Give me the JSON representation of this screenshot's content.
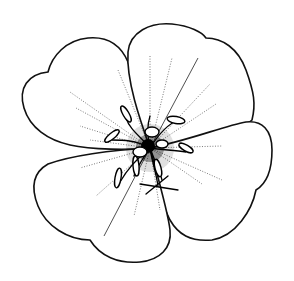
{
  "image": {
    "subject": "Flower line drawing",
    "description": "Botanical pen illustration of a five-petaled flower, top view, with notched petals, radiating stippled veins and a dense cluster of stamens and anthers at the centre",
    "width": 294,
    "height": 281,
    "colors": {
      "background": "#ffffff",
      "ink": "#111111"
    },
    "petal_count": 5,
    "petals": [
      {
        "position": "upper-left"
      },
      {
        "position": "upper-right"
      },
      {
        "position": "right"
      },
      {
        "position": "lower-right"
      },
      {
        "position": "lower-left"
      }
    ],
    "center": {
      "x": 150,
      "y": 148
    }
  }
}
